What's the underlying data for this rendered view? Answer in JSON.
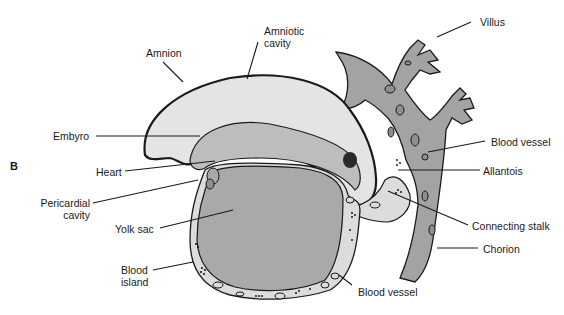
{
  "figure": {
    "panel_label": "B",
    "colors": {
      "background": "#ffffff",
      "outline": "#1a1a1a",
      "amniotic_cavity": "#e4e4e4",
      "tissue_medium": "#bdbdbd",
      "yolk_sac": "#a9a9a9",
      "chorion": "#a3a3a3",
      "light_mesoderm": "#dcdcdc"
    },
    "labels": {
      "amnion": "Amnion",
      "amniotic_cavity_1": "Amniotic",
      "amniotic_cavity_2": "cavity",
      "villus": "Villus",
      "embryo": "Embyro",
      "blood_vessel_top": "Blood vessel",
      "heart": "Heart",
      "allantois": "Allantois",
      "pericardial_cavity_1": "Pericardial",
      "pericardial_cavity_2": "cavity",
      "yolk_sac": "Yolk sac",
      "connecting_stalk": "Connecting stalk",
      "chorion": "Chorion",
      "blood_island_1": "Blood",
      "blood_island_2": "island",
      "blood_vessel_bottom": "Blood vessel"
    }
  }
}
